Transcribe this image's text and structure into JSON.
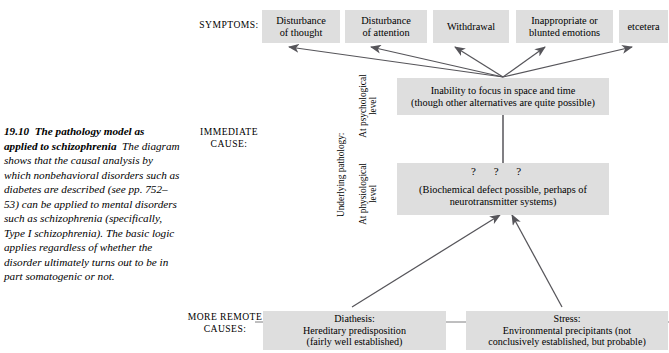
{
  "figure": {
    "number": "19.10",
    "title": "The pathology model as applied to schizophrenia",
    "caption": "The diagram shows that the causal analysis by which nonbehavioral disorders such as diabetes are described (see pp. 752–53) can be applied to mental disorders such as schizophrenia (specifically, Type I schizophrenia). The basic logic applies regardless of whether the disorder ultimately turns out to be in part somatogenic or not."
  },
  "row_labels": {
    "symptoms": "SYMPTOMS:",
    "immediate_cause_line1": "IMMEDIATE",
    "immediate_cause_line2": "CAUSE:",
    "more_remote_line1": "MORE REMOTE",
    "more_remote_line2": "CAUSES:"
  },
  "brace": {
    "label": "Underlying pathology:",
    "level_psychological_line1": "At psychological",
    "level_psychological_line2": "level",
    "level_physiological_line1": "At physiological",
    "level_physiological_line2": "level"
  },
  "symptoms": [
    {
      "line1": "Disturbance",
      "line2": "of thought"
    },
    {
      "line1": "Disturbance",
      "line2": "of attention"
    },
    {
      "line1": "Withdrawal",
      "line2": ""
    },
    {
      "line1": "Inappropriate or",
      "line2": "blunted emotions"
    },
    {
      "line1": "etcetera",
      "line2": ""
    }
  ],
  "immediate_cause": {
    "psychological": {
      "line1": "Inability to focus in space and time",
      "line2": "(though other alternatives are quite possible)"
    },
    "physiological": {
      "question_marks": "? ? ?",
      "line1": "(Biochemical defect possible, perhaps of",
      "line2": "neurotransmitter systems)"
    }
  },
  "remote_causes": [
    {
      "line1": "Diathesis:",
      "line2": "Hereditary predisposition",
      "line3": "(fairly well established)"
    },
    {
      "line1": "Stress:",
      "line2": "Environmental precipitants (not",
      "line3": "conclusively established, but probable)"
    }
  ],
  "colors": {
    "box_fill": "#dedede",
    "arrow": "#56555a",
    "text": "#000000",
    "background": "#ffffff"
  }
}
